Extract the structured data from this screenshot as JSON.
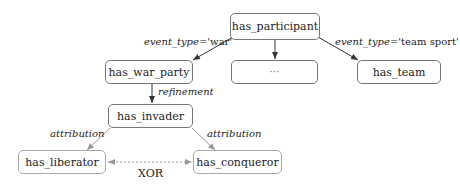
{
  "nodes": {
    "root": "has_participant",
    "war_party": "has_war_party",
    "ellipsis": "···",
    "team": "has_team",
    "invader": "has_invader",
    "liberator": "has_liberator",
    "conqueror": "has_conqueror"
  },
  "edges": {
    "war_label_key": "event_type",
    "war_label_val": "='war'",
    "team_label_key": "event_type",
    "team_label_val": "='team sport'",
    "refinement": "refinement",
    "attribution_left": "attribution",
    "attribution_right": "attribution",
    "xor": "XOR"
  },
  "colors": {
    "dark_edge": "#333333",
    "light_edge": "#999999",
    "node_border": "#777777"
  }
}
